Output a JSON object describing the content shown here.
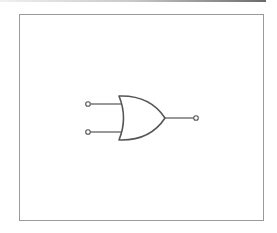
{
  "diagram": {
    "type": "logic-gate",
    "gate": "OR",
    "inputs": [
      {
        "id": "A",
        "terminal": {
          "x": 88,
          "y": 104
        }
      },
      {
        "id": "B",
        "terminal": {
          "x": 88,
          "y": 132
        }
      }
    ],
    "output": {
      "id": "Y",
      "terminal": {
        "x": 196,
        "y": 118
      }
    },
    "colors": {
      "stroke": "#555555",
      "frame": "#9a9a9a",
      "background": "#ffffff"
    }
  }
}
